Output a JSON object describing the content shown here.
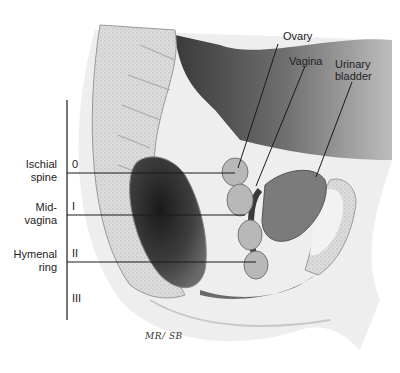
{
  "figure": {
    "structure_labels": {
      "ovary": "Ovary",
      "vagina": "Vagina",
      "urinary_bladder_line1": "Urinary",
      "urinary_bladder_line2": "bladder"
    },
    "reference_levels": [
      {
        "label_line1": "Ischial",
        "label_line2": "spine",
        "grade": "0"
      },
      {
        "label_line1": "Mid-",
        "label_line2": "vagina",
        "grade": "I"
      },
      {
        "label_line1": "Hymenal",
        "label_line2": "ring",
        "grade": "II"
      },
      {
        "label_line1": "",
        "label_line2": "",
        "grade": "III"
      }
    ],
    "signature": "MR/ SB"
  },
  "colors": {
    "bone": "#d9d9d9",
    "tissue_dark": "#555555",
    "tissue_mid": "#8a8a8a",
    "line": "#1a1a1a"
  }
}
